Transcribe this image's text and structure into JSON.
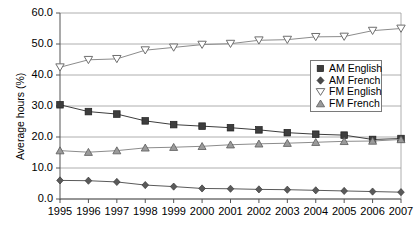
{
  "chart_data": {
    "type": "line",
    "title": "",
    "xlabel": "",
    "ylabel": "Average hours (%)",
    "categories": [
      "1995",
      "1996",
      "1997",
      "1998",
      "1999",
      "2000",
      "2001",
      "2002",
      "2003",
      "2004",
      "2005",
      "2006",
      "2007"
    ],
    "x": [
      1995,
      1996,
      1997,
      1998,
      1999,
      2000,
      2001,
      2002,
      2003,
      2004,
      2005,
      2006,
      2007
    ],
    "ylim": [
      0.0,
      60.0
    ],
    "xlim": [
      1995,
      2007
    ],
    "yticks": [
      "0.0",
      "10.0",
      "20.0",
      "30.0",
      "40.0",
      "50.0",
      "60.0"
    ],
    "ytick_values": [
      0.0,
      10.0,
      20.0,
      30.0,
      40.0,
      50.0,
      60.0
    ],
    "grid": true,
    "grid_axis": "y",
    "legend_position": "center-right",
    "series": [
      {
        "name": "AM English",
        "marker": "filled-square",
        "color": "#3d3d3d",
        "values": [
          30.4,
          28.2,
          27.4,
          25.2,
          24.0,
          23.5,
          23.0,
          22.3,
          21.4,
          20.9,
          20.6,
          19.2,
          19.5
        ]
      },
      {
        "name": "AM French",
        "marker": "filled-diamond",
        "color": "#5a5a5a",
        "values": [
          6.0,
          5.9,
          5.5,
          4.5,
          4.0,
          3.4,
          3.3,
          3.1,
          3.0,
          2.8,
          2.6,
          2.4,
          2.2
        ]
      },
      {
        "name": "FM English",
        "marker": "open-triangle-down",
        "color": "#8c8c8c",
        "values": [
          42.5,
          44.9,
          45.2,
          48.0,
          48.9,
          49.8,
          50.1,
          51.2,
          51.4,
          52.3,
          52.4,
          54.3,
          55.0
        ]
      },
      {
        "name": "FM French",
        "marker": "filled-triangle-up",
        "color": "#8c8c8c",
        "values": [
          15.6,
          15.1,
          15.6,
          16.5,
          16.7,
          17.0,
          17.5,
          17.8,
          18.0,
          18.3,
          18.6,
          18.7,
          19.2
        ]
      }
    ]
  },
  "axis": {
    "y_title": "Average hours (%)"
  },
  "legend": {
    "items": [
      {
        "label": "AM English",
        "marker": "filled-square",
        "icon": "square-icon"
      },
      {
        "label": "AM French",
        "marker": "filled-diamond",
        "icon": "diamond-icon"
      },
      {
        "label": "FM English",
        "marker": "open-triangle-down",
        "icon": "triangle-down-icon"
      },
      {
        "label": "FM French",
        "marker": "filled-triangle-up",
        "icon": "triangle-up-icon"
      }
    ]
  }
}
